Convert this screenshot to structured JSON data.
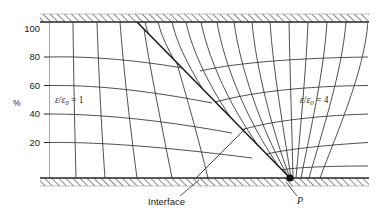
{
  "figure": {
    "kind": "field-map-diagram",
    "background_color": "#ffffff",
    "line_color": "#262626",
    "hatch_color": "#555555",
    "axis": {
      "unit_label": "%",
      "tick_labels": [
        "100",
        "80",
        "60",
        "40",
        "20"
      ],
      "tick_values": [
        100,
        80,
        60,
        40,
        20
      ]
    },
    "regions": [
      {
        "name": "left-dielectric",
        "label_html": "<span class=\"gl\">&#949;</span>/<span class=\"gl\">&#949;</span><sub>0</sub> = 1",
        "permittivity_ratio": 1
      },
      {
        "name": "right-dielectric",
        "label_html": "<span class=\"gl\">&#949;</span>/<span class=\"gl\">&#949;</span><sub>0</sub> = 4",
        "permittivity_ratio": 4
      }
    ],
    "annotations": [
      {
        "name": "interface",
        "text": "Interface"
      },
      {
        "name": "point-p",
        "text": "P"
      }
    ]
  },
  "chart_data": {
    "type": "line",
    "title": "",
    "subtitle": "",
    "xlabel": "",
    "ylabel": "%",
    "grid": true,
    "legend": "none",
    "ylim": [
      0,
      108
    ],
    "xlim": [
      0,
      383
    ],
    "y_ticks": [
      100,
      80,
      60,
      40,
      20
    ],
    "y_tick_px": [
      28.5,
      57,
      85.5,
      114,
      142.5
    ],
    "plot_box_px": {
      "left": 49,
      "right": 368,
      "top": 22,
      "bottom": 178
    },
    "hatched_bands_px": [
      {
        "name": "top-conductor",
        "x": 40,
        "y": 14,
        "w": 329,
        "h": 8
      },
      {
        "name": "bottom-conductor",
        "x": 40,
        "y": 178,
        "w": 329,
        "h": 8
      }
    ],
    "interface_line_px": {
      "x1": 137,
      "y1": 22,
      "x2": 290,
      "y2": 178
    },
    "point_p_px": {
      "x": 290,
      "y": 178
    },
    "series": [
      {
        "name": "equipotentials-left",
        "values": [
          100,
          80,
          60,
          40,
          20
        ]
      },
      {
        "name": "equipotentials-right",
        "values": [
          100,
          80,
          60,
          40,
          20
        ]
      },
      {
        "name": "flux-lines-left",
        "count": 5
      },
      {
        "name": "flux-lines-right",
        "count": 13
      }
    ]
  }
}
